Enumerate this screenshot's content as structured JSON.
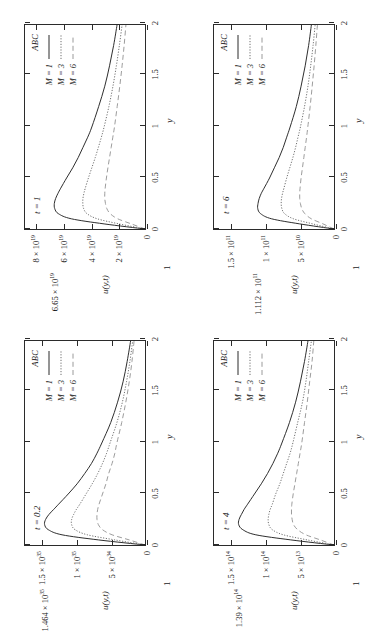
{
  "figure": {
    "legend_title": "ABC",
    "series_names": [
      "M = 1",
      "M = 6",
      "M = 3"
    ],
    "x_axis_title": "y",
    "y_axis_title": "u(y,t)",
    "colors": {
      "axis": "#2b2b2b",
      "curve_m1": "#2b2b2b",
      "curve_m3": "#6e6e6e",
      "curve_m6": "#9a9a9a",
      "background": "#ffffff"
    },
    "one_mark": "1"
  },
  "chart_data": [
    {
      "type": "line",
      "title": "t = 0.2",
      "xlabel": "y",
      "ylabel": "u(y,t)",
      "xlim": [
        0,
        2
      ],
      "ylim": [
        0,
        1.75e+35
      ],
      "xticks": [
        0,
        0.5,
        1,
        1.5,
        2
      ],
      "xticklabels": [
        "0",
        "0.5",
        "1",
        "1.5",
        "2"
      ],
      "yticks": [
        0,
        5e+34,
        1e+35,
        1.5e+35
      ],
      "yticklabels": [
        "0",
        "5 × 10^34",
        "1 × 10^35",
        "1.5 × 10^35"
      ],
      "special_ytick": 1.464e+35,
      "special_yticklabel": "1.464 × 10^35",
      "grid": false,
      "legend_position": "top-right",
      "x": [
        0,
        0.05,
        0.1,
        0.15,
        0.2,
        0.25,
        0.3,
        0.35,
        0.4,
        0.5,
        0.6,
        0.7,
        0.8,
        0.9,
        1.0,
        1.2,
        1.4,
        1.6,
        1.8,
        2.0
      ],
      "series": [
        {
          "name": "M = 1",
          "style": "solid",
          "values": [
            0,
            6.8e+34,
            1.21e+35,
            1.41e+35,
            1.464e+35,
            1.45e+35,
            1.4e+35,
            1.33e+35,
            1.26e+35,
            1.12e+35,
            9.9e+34,
            8.8e+34,
            7.8e+34,
            7e+34,
            6.3e+34,
            5e+34,
            4e+34,
            3.2e+34,
            2.6e+34,
            2.1e+34
          ]
        },
        {
          "name": "M = 3",
          "style": "dotted",
          "values": [
            0,
            4.4e+34,
            8.4e+34,
            1.02e+35,
            1.07e+35,
            1.07e+35,
            1.04e+35,
            1e+35,
            9.5e+34,
            8.6e+34,
            7.7e+34,
            6.9e+34,
            6.2e+34,
            5.6e+34,
            5.1e+34,
            4.1e+34,
            3.3e+34,
            2.7e+34,
            2.2e+34,
            1.8e+34
          ]
        },
        {
          "name": "M = 6",
          "style": "dashed",
          "values": [
            0,
            2.3e+34,
            4.8e+34,
            6.2e+34,
            6.8e+34,
            7e+34,
            7e+34,
            6.9e+34,
            6.7e+34,
            6.2e+34,
            5.7e+34,
            5.3e+34,
            4.8e+34,
            4.4e+34,
            4.1e+34,
            3.4e+34,
            2.8e+34,
            2.3e+34,
            1.9e+34,
            1.6e+34
          ]
        }
      ]
    },
    {
      "type": "line",
      "title": "t = 1",
      "xlabel": "y",
      "ylabel": "u(y,t)",
      "xlim": [
        0,
        2
      ],
      "ylim": [
        0,
        8.8e+19
      ],
      "xticks": [
        0,
        0.5,
        1,
        1.5,
        2
      ],
      "xticklabels": [
        "0",
        "0.5",
        "1",
        "1.5",
        "2"
      ],
      "yticks": [
        0,
        2e+19,
        4e+19,
        6e+19,
        8e+19
      ],
      "yticklabels": [
        "0",
        "2 × 10^19",
        "4 × 10^19",
        "6 × 10^19",
        "8 × 10^19"
      ],
      "special_ytick": 6.65e+19,
      "special_yticklabel": "6.65 × 10^19",
      "grid": false,
      "legend_position": "top-right",
      "x": [
        0,
        0.05,
        0.1,
        0.15,
        0.2,
        0.25,
        0.3,
        0.35,
        0.4,
        0.5,
        0.6,
        0.7,
        0.8,
        0.9,
        1.0,
        1.2,
        1.4,
        1.6,
        1.8,
        2.0
      ],
      "series": [
        {
          "name": "M = 1",
          "style": "solid",
          "values": [
            0,
            3e+19,
            5.4e+19,
            6.35e+19,
            6.62e+19,
            6.65e+19,
            6.55e+19,
            6.38e+19,
            6.18e+19,
            5.75e+19,
            5.3e+19,
            4.9e+19,
            4.55e+19,
            4.2e+19,
            3.9e+19,
            3.4e+19,
            2.95e+19,
            2.6e+19,
            2.3e+19,
            2.05e+19
          ]
        },
        {
          "name": "M = 3",
          "style": "dotted",
          "values": [
            0,
            1.9e+19,
            3.5e+19,
            4.25e+19,
            4.5e+19,
            4.56e+19,
            4.55e+19,
            4.48e+19,
            4.38e+19,
            4.15e+19,
            3.9e+19,
            3.65e+19,
            3.42e+19,
            3.2e+19,
            3e+19,
            2.65e+19,
            2.35e+19,
            2.1e+19,
            1.88e+19,
            1.68e+19
          ]
        },
        {
          "name": "M = 6",
          "style": "dashed",
          "values": [
            0,
            1e+19,
            2e+19,
            2.55e+19,
            2.8e+19,
            2.9e+19,
            2.95e+19,
            2.95e+19,
            2.92e+19,
            2.83e+19,
            2.72e+19,
            2.6e+19,
            2.48e+19,
            2.36e+19,
            2.24e+19,
            2.04e+19,
            1.85e+19,
            1.68e+19,
            1.53e+19,
            1.4e+19
          ]
        }
      ]
    },
    {
      "type": "line",
      "title": "t = 4",
      "xlabel": "y",
      "ylabel": "u(y,t)",
      "xlim": [
        0,
        2
      ],
      "ylim": [
        0,
        175000000000000.0
      ],
      "xticks": [
        0,
        0.5,
        1,
        1.5,
        2
      ],
      "xticklabels": [
        "0",
        "0.5",
        "1",
        "1.5",
        "2"
      ],
      "yticks": [
        0,
        50000000000000.0,
        100000000000000.0,
        150000000000000.0
      ],
      "yticklabels": [
        "0",
        "5 × 10^13",
        "1 × 10^14",
        "1.5 × 10^14"
      ],
      "special_ytick": 139000000000000.0,
      "special_yticklabel": "1.39 × 10^14",
      "grid": false,
      "legend_position": "top-right",
      "x": [
        0,
        0.05,
        0.1,
        0.15,
        0.2,
        0.25,
        0.3,
        0.35,
        0.4,
        0.5,
        0.6,
        0.7,
        0.8,
        0.9,
        1.0,
        1.2,
        1.4,
        1.6,
        1.8,
        2.0
      ],
      "series": [
        {
          "name": "M = 1",
          "style": "solid",
          "values": [
            0,
            63000000000000.0,
            114000000000000.0,
            133000000000000.0,
            139000000000000.0,
            138500000000000.0,
            135000000000000.0,
            131000000000000.0,
            126000000000000.0,
            116000000000000.0,
            106000000000000.0,
            97000000000000.0,
            89000000000000.0,
            82000000000000.0,
            76000000000000.0,
            65000000000000.0,
            56000000000000.0,
            49000000000000.0,
            43000000000000.0,
            38000000000000.0
          ]
        },
        {
          "name": "M = 3",
          "style": "dotted",
          "values": [
            0,
            39000000000000.0,
            74000000000000.0,
            90000000000000.0,
            95000000000000.0,
            96000000000000.0,
            95000000000000.0,
            93000000000000.0,
            90000000000000.0,
            85000000000000.0,
            79000000000000.0,
            74000000000000.0,
            69000000000000.0,
            64000000000000.0,
            60000000000000.0,
            53000000000000.0,
            46000000000000.0,
            41000000000000.0,
            37000000000000.0,
            33000000000000.0
          ]
        },
        {
          "name": "M = 6",
          "style": "dashed",
          "values": [
            0,
            20000000000000.0,
            41000000000000.0,
            53000000000000.0,
            59000000000000.0,
            61000000000000.0,
            62000000000000.0,
            62000000000000.0,
            61500000000000.0,
            59500000000000.0,
            57000000000000.0,
            54500000000000.0,
            52000000000000.0,
            49500000000000.0,
            47000000000000.0,
            43000000000000.0,
            39000000000000.0,
            35500000000000.0,
            32000000000000.0,
            29500000000000.0
          ]
        }
      ]
    },
    {
      "type": "line",
      "title": "t = 6",
      "xlabel": "y",
      "ylabel": "u(y,t)",
      "xlim": [
        0,
        2
      ],
      "ylim": [
        0,
        175000000000.0
      ],
      "xticks": [
        0,
        0.5,
        1,
        1.5,
        2
      ],
      "xticklabels": [
        "0",
        "0.5",
        "1",
        "1.5",
        "2"
      ],
      "yticks": [
        0,
        50000000000.0,
        100000000000.0,
        150000000000.0
      ],
      "yticklabels": [
        "0",
        "5 × 10^10",
        "1 × 10^11",
        "1.5 × 10^11"
      ],
      "special_ytick": 111200000000.0,
      "special_yticklabel": "1.112 × 10^11",
      "grid": false,
      "legend_position": "top-right",
      "x": [
        0,
        0.05,
        0.1,
        0.15,
        0.2,
        0.25,
        0.3,
        0.35,
        0.4,
        0.5,
        0.6,
        0.7,
        0.8,
        0.9,
        1.0,
        1.2,
        1.4,
        1.6,
        1.8,
        2.0
      ],
      "series": [
        {
          "name": "M = 1",
          "style": "solid",
          "values": [
            0,
            50000000000.0,
            91000000000.0,
            107000000000.0,
            111200000000.0,
            110800000000.0,
            109000000000.0,
            106000000000.0,
            102000000000.0,
            94000000000.0,
            87000000000.0,
            80000000000.0,
            74000000000.0,
            69000000000.0,
            64000000000.0,
            55000000000.0,
            48000000000.0,
            42000000000.0,
            37000000000.0,
            33000000000.0
          ]
        },
        {
          "name": "M = 3",
          "style": "dotted",
          "values": [
            0,
            31000000000.0,
            59000000000.0,
            72000000000.0,
            76000000000.0,
            77000000000.0,
            76500000000.0,
            75000000000.0,
            73000000000.0,
            69000000000.0,
            64500000000.0,
            60000000000.0,
            56000000000.0,
            52500000000.0,
            49000000000.0,
            43000000000.0,
            38000000000.0,
            34000000000.0,
            30500000000.0,
            27500000000.0
          ]
        },
        {
          "name": "M = 6",
          "style": "dashed",
          "values": [
            0,
            16000000000.0,
            33000000000.0,
            42500000000.0,
            47000000000.0,
            49000000000.0,
            50000000000.0,
            50000000000.0,
            49500000000.0,
            48000000000.0,
            46000000000.0,
            44000000000.0,
            42000000000.0,
            40000000000.0,
            38200000000.0,
            34800000000.0,
            31800000000.0,
            29000000000.0,
            26500000000.0,
            24200000000.0
          ]
        }
      ]
    }
  ]
}
